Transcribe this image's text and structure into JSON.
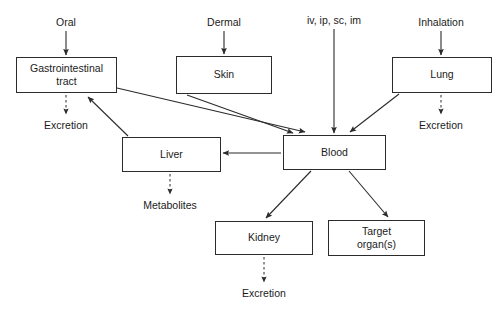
{
  "diagram": {
    "background_color": "#ffffff",
    "line_color": "#2b2b2b",
    "text_color": "#1b1b1b",
    "nodes": [
      {
        "id": "gi",
        "label": "Gastrointestinal\ntract",
        "x": 16,
        "y": 57,
        "w": 101,
        "h": 36
      },
      {
        "id": "skin",
        "label": "Skin",
        "x": 176,
        "y": 56,
        "w": 96,
        "h": 38
      },
      {
        "id": "lung",
        "label": "Lung",
        "x": 392,
        "y": 57,
        "w": 100,
        "h": 36
      },
      {
        "id": "liver",
        "label": "Liver",
        "x": 122,
        "y": 137,
        "w": 99,
        "h": 35
      },
      {
        "id": "blood",
        "label": "Blood",
        "x": 283,
        "y": 135,
        "w": 103,
        "h": 35
      },
      {
        "id": "kidney",
        "label": "Kidney",
        "x": 215,
        "y": 221,
        "w": 98,
        "h": 34
      },
      {
        "id": "target",
        "label": "Target\norgan(s)",
        "x": 328,
        "y": 220,
        "w": 97,
        "h": 36
      }
    ],
    "captions": [
      {
        "id": "route-oral",
        "label": "Oral",
        "x": 66,
        "y": 16
      },
      {
        "id": "route-dermal",
        "label": "Dermal",
        "x": 224,
        "y": 16
      },
      {
        "id": "route-parenteral",
        "label": "iv, ip, sc, im",
        "x": 334,
        "y": 14
      },
      {
        "id": "route-inhalation",
        "label": "Inhalation",
        "x": 441,
        "y": 16
      },
      {
        "id": "output-excretion-gi",
        "label": "Excretion",
        "x": 66,
        "y": 119
      },
      {
        "id": "output-excretion-lung",
        "label": "Excretion",
        "x": 441,
        "y": 119
      },
      {
        "id": "output-metabolites",
        "label": "Metabolites",
        "x": 170,
        "y": 199
      },
      {
        "id": "output-excretion-kidney",
        "label": "Excretion",
        "x": 264,
        "y": 287
      }
    ],
    "edges": [
      {
        "id": "oral-to-gi",
        "from": "route-oral",
        "to": "gi",
        "style": "solid",
        "x1": 66,
        "y1": 31,
        "x2": 66,
        "y2": 55
      },
      {
        "id": "dermal-to-skin",
        "from": "route-dermal",
        "to": "skin",
        "style": "solid",
        "x1": 224,
        "y1": 31,
        "x2": 224,
        "y2": 54
      },
      {
        "id": "parenteral-to-blood",
        "from": "route-parenteral",
        "to": "blood",
        "style": "solid",
        "x1": 334,
        "y1": 29,
        "x2": 334,
        "y2": 133
      },
      {
        "id": "inhalation-to-lung",
        "from": "route-inhalation",
        "to": "lung",
        "style": "solid",
        "x1": 441,
        "y1": 31,
        "x2": 441,
        "y2": 55
      },
      {
        "id": "gi-to-blood",
        "from": "gi",
        "to": "blood",
        "style": "solid",
        "x1": 117,
        "y1": 88,
        "x2": 305,
        "y2": 132
      },
      {
        "id": "skin-to-blood",
        "from": "skin",
        "to": "blood",
        "style": "solid",
        "x1": 187,
        "y1": 95,
        "x2": 293,
        "y2": 133
      },
      {
        "id": "lung-to-blood",
        "from": "lung",
        "to": "blood",
        "style": "solid",
        "x1": 399,
        "y1": 94,
        "x2": 350,
        "y2": 132
      },
      {
        "id": "blood-to-liver",
        "from": "blood",
        "to": "liver",
        "style": "solid",
        "x1": 281,
        "y1": 153,
        "x2": 223,
        "y2": 153
      },
      {
        "id": "liver-to-gi",
        "from": "liver",
        "to": "gi",
        "style": "solid",
        "x1": 128,
        "y1": 136,
        "x2": 88,
        "y2": 97
      },
      {
        "id": "blood-to-kidney",
        "from": "blood",
        "to": "kidney",
        "style": "solid",
        "x1": 311,
        "y1": 171,
        "x2": 266,
        "y2": 218
      },
      {
        "id": "blood-to-target",
        "from": "blood",
        "to": "target",
        "style": "solid",
        "x1": 349,
        "y1": 171,
        "x2": 388,
        "y2": 217
      },
      {
        "id": "gi-to-excretion",
        "from": "gi",
        "to": "output-excretion-gi",
        "style": "dashed",
        "x1": 66,
        "y1": 95,
        "x2": 66,
        "y2": 114
      },
      {
        "id": "lung-to-excretion",
        "from": "lung",
        "to": "output-excretion-lung",
        "style": "dashed",
        "x1": 441,
        "y1": 95,
        "x2": 441,
        "y2": 114
      },
      {
        "id": "liver-to-metabolites",
        "from": "liver",
        "to": "output-metabolites",
        "style": "dashed",
        "x1": 170,
        "y1": 174,
        "x2": 170,
        "y2": 194
      },
      {
        "id": "kidney-to-excretion",
        "from": "kidney",
        "to": "output-excretion-kidney",
        "style": "dashed",
        "x1": 264,
        "y1": 257,
        "x2": 264,
        "y2": 282
      }
    ]
  }
}
